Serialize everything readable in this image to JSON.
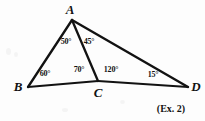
{
  "figure": {
    "background_color": "#fdfdfd",
    "ink_color": "#121212",
    "caption": "(Ex. 2)",
    "vertices": [
      {
        "name": "A",
        "label": "A",
        "x": 72,
        "y": 20,
        "label_x": 70,
        "label_y": 9
      },
      {
        "name": "B",
        "label": "B",
        "x": 28,
        "y": 87,
        "label_x": 18,
        "label_y": 86
      },
      {
        "name": "C",
        "label": "C",
        "x": 98,
        "y": 81,
        "label_x": 98,
        "label_y": 92
      },
      {
        "name": "D",
        "label": "D",
        "x": 188,
        "y": 87,
        "label_x": 196,
        "label_y": 86
      }
    ],
    "segments": [
      {
        "name": "segment-ab",
        "from": "A",
        "to": "B"
      },
      {
        "name": "segment-ac",
        "from": "A",
        "to": "C"
      },
      {
        "name": "segment-ad",
        "from": "A",
        "to": "D"
      },
      {
        "name": "segment-bc",
        "from": "B",
        "to": "C"
      },
      {
        "name": "segment-cd",
        "from": "C",
        "to": "D"
      }
    ],
    "angles": [
      {
        "name": "angle-bac",
        "vertex": "A",
        "text": "50°",
        "x": 66,
        "y": 42
      },
      {
        "name": "angle-cad",
        "vertex": "A",
        "text": "45°",
        "x": 89,
        "y": 42
      },
      {
        "name": "angle-abc",
        "vertex": "B",
        "text": "60°",
        "x": 45,
        "y": 74
      },
      {
        "name": "angle-acb",
        "vertex": "C",
        "text": "70°",
        "x": 79,
        "y": 70
      },
      {
        "name": "angle-acd",
        "vertex": "C",
        "text": "120°",
        "x": 111,
        "y": 70
      },
      {
        "name": "angle-adc",
        "vertex": "D",
        "text": "15°",
        "x": 153,
        "y": 75
      }
    ],
    "caption_pos": {
      "x": 171,
      "y": 108
    }
  }
}
